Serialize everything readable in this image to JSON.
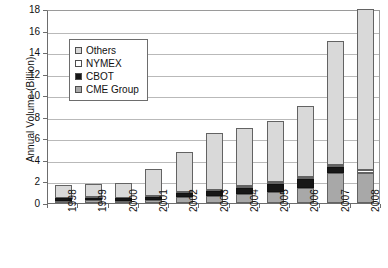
{
  "chart_data": {
    "type": "bar",
    "subtype": "stacked",
    "title": "",
    "xlabel": "",
    "ylabel": "Annual Volume (Billion)",
    "ylim": [
      0,
      18
    ],
    "ytick_step": 2,
    "yticks": [
      "0",
      "2",
      "4",
      "6",
      "8",
      "10",
      "12",
      "14",
      "16",
      "18"
    ],
    "grid": "horizontal",
    "legend_position": "upper-left-inside",
    "categories": [
      "1998",
      "1999",
      "2000",
      "2001",
      "2002",
      "2003",
      "2004",
      "2005",
      "2006",
      "2007",
      "2008"
    ],
    "series": [
      {
        "name": "CME Group",
        "color": "#a8a8a8",
        "values": [
          0.23,
          0.25,
          0.23,
          0.31,
          0.56,
          0.64,
          0.81,
          1.05,
          1.4,
          2.8,
          2.75
        ]
      },
      {
        "name": "CBOT",
        "color": "#171717",
        "values": [
          0.21,
          0.22,
          0.21,
          0.26,
          0.35,
          0.45,
          0.6,
          0.67,
          0.8,
          0.5,
          0.0
        ]
      },
      {
        "name": "NYMEX",
        "color": "#ffffff",
        "values": [
          0.06,
          0.06,
          0.07,
          0.1,
          0.14,
          0.16,
          0.18,
          0.2,
          0.23,
          0.2,
          0.3
        ]
      },
      {
        "name": "Others",
        "color": "#d9d9d9",
        "values": [
          1.2,
          1.27,
          1.39,
          2.53,
          3.65,
          5.25,
          5.41,
          5.68,
          6.57,
          11.5,
          14.95
        ]
      }
    ],
    "totals": [
      1.7,
      1.8,
      1.9,
      3.2,
      4.7,
      6.5,
      7.0,
      7.6,
      9.0,
      15.0,
      18.0
    ]
  },
  "legend": {
    "entries": [
      {
        "label": "Others",
        "swatch": "others"
      },
      {
        "label": "NYMEX",
        "swatch": "nymex"
      },
      {
        "label": "CBOT",
        "swatch": "cbot"
      },
      {
        "label": "CME Group",
        "swatch": "cme"
      }
    ]
  }
}
